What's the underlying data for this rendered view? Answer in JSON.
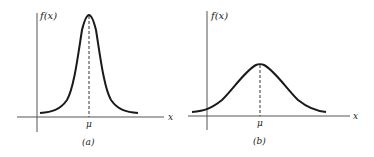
{
  "figure": {
    "colors": {
      "ink": "#1a1a1a",
      "axis": "#555555",
      "background": "#ffffff"
    },
    "panels": [
      {
        "id": "a",
        "caption": "(a)",
        "y_axis_label": "f(x)",
        "x_axis_label": "x",
        "mean_label": "μ",
        "description": "Normal density with small variance (tall, narrow)"
      },
      {
        "id": "b",
        "caption": "(b)",
        "y_axis_label": "f(x)",
        "x_axis_label": "x",
        "mean_label": "μ",
        "description": "Normal density with large variance (short, wide)"
      }
    ]
  }
}
